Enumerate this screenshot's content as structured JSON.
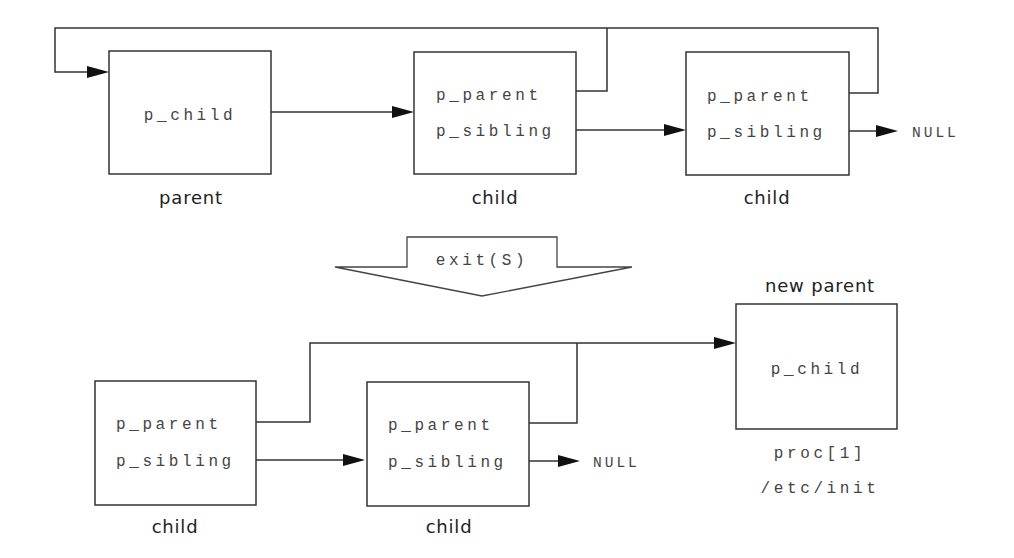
{
  "diagram": {
    "before": {
      "parent": {
        "fields": [
          "p_child"
        ],
        "label": "parent"
      },
      "child1": {
        "fields": [
          "p_parent",
          "p_sibling"
        ],
        "label": "child"
      },
      "child2": {
        "fields": [
          "p_parent",
          "p_sibling"
        ],
        "label": "child",
        "sibling_target": "NULL"
      }
    },
    "transition": {
      "label": "exit(S)"
    },
    "after": {
      "child1": {
        "fields": [
          "p_parent",
          "p_sibling"
        ],
        "label": "child"
      },
      "child2": {
        "fields": [
          "p_parent",
          "p_sibling"
        ],
        "label": "child",
        "sibling_target": "NULL"
      },
      "new_parent": {
        "title": "new parent",
        "fields": [
          "p_child"
        ],
        "label_lines": [
          "proc[1]",
          "/etc/init"
        ]
      }
    },
    "colors": {
      "line": "#333333",
      "arrowhead": "#111111",
      "text": "#444444",
      "background": "#ffffff"
    }
  }
}
